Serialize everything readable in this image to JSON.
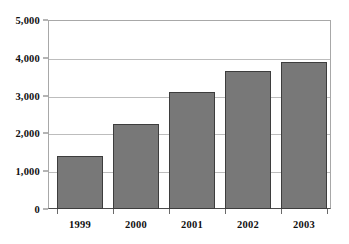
{
  "chart_data": {
    "type": "bar",
    "title": "",
    "subtitle": "",
    "xlabel": "",
    "ylabel": "",
    "categories": [
      "1999",
      "2000",
      "2001",
      "2002",
      "2003"
    ],
    "values": [
      1400,
      2250,
      3100,
      3650,
      3900
    ],
    "series": [
      {
        "name": "",
        "values": [
          1400,
          2250,
          3100,
          3650,
          3900
        ]
      }
    ],
    "ylim": [
      0,
      5000
    ],
    "ytick_values": [
      0,
      1000,
      2000,
      3000,
      4000,
      5000
    ],
    "ytick_labels": [
      "0",
      "1,000",
      "2,000",
      "3,000",
      "4,000",
      "5,000"
    ],
    "grid": true,
    "grid_axis": "y",
    "legend": false,
    "legend_position": "none",
    "annotations": [],
    "colors": {
      "bar_fill": "#787878",
      "bar_border": "#3d3d3d",
      "gridline": "#bdbdbd",
      "axis": "#4a4a4a",
      "plot_border": "#a8a8a8",
      "background": "#ffffff",
      "text": "#111111"
    }
  }
}
